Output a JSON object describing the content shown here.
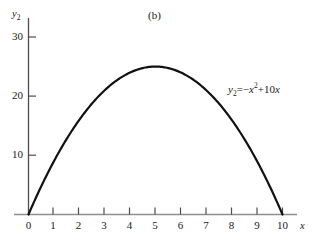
{
  "figure": {
    "panel_label": "(b)",
    "background_color": "#ffffff",
    "curve_color": "#111111",
    "axis_color": "#8c8c8c",
    "y_axis_color": "#555555",
    "text_color": "#1a1a1a"
  },
  "annotation": {
    "equation_var": "y",
    "equation_sub": "2",
    "equation_eq": "=",
    "equation_neg": "−",
    "equation_x": "x",
    "equation_pow": "2",
    "equation_plus": "+",
    "equation_lin": "10",
    "equation_x2": "x",
    "equation_full": "y2 = -x^2 + 10x"
  },
  "axes": {
    "x_name": "x",
    "y_name": "y",
    "y_name_sub": "2"
  },
  "chart_data": {
    "type": "line",
    "title": "(b)",
    "xlabel": "x",
    "ylabel": "y2",
    "xlim": [
      0,
      10.6
    ],
    "ylim": [
      0,
      32
    ],
    "grid": false,
    "legend": null,
    "annotations": [
      {
        "text": "(b)",
        "x": 5.0,
        "y": 31.5
      },
      {
        "text": "y2 = -x^2 + 10x",
        "x": 8.55,
        "y": 21.8
      }
    ],
    "xticks": [
      0,
      1,
      2,
      3,
      4,
      5,
      6,
      7,
      8,
      9,
      10
    ],
    "xtick_labels": [
      "0",
      "1",
      "2",
      "3",
      "4",
      "5",
      "6",
      "7",
      "8",
      "9",
      "10"
    ],
    "yticks": [
      0,
      10,
      20,
      30
    ],
    "ytick_labels": [
      "0",
      "10",
      "20",
      "30"
    ],
    "series": [
      {
        "name": "y2 = -x^2 + 10x",
        "equation": "y = -x^2 + 10x",
        "color": "#111111",
        "x": [
          0,
          0.5,
          1,
          1.5,
          2,
          2.5,
          3,
          3.5,
          4,
          4.5,
          5,
          5.5,
          6,
          6.5,
          7,
          7.5,
          8,
          8.5,
          9,
          9.5,
          10
        ],
        "values": [
          0,
          4.75,
          9,
          12.75,
          16,
          18.75,
          21,
          22.75,
          24,
          24.75,
          25,
          24.75,
          24,
          22.75,
          21,
          18.75,
          16,
          12.75,
          9,
          4.75,
          0
        ],
        "vertex": {
          "x": 5,
          "y": 25
        },
        "roots": [
          0,
          10
        ]
      }
    ]
  }
}
